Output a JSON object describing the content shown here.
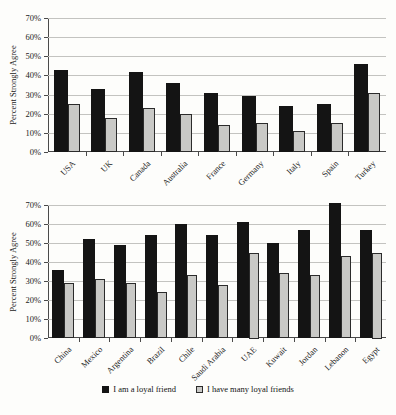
{
  "chart_data": [
    {
      "type": "bar",
      "panel": "western-countries",
      "title": "",
      "ylabel": "Percent Strongly Agree",
      "xlabel": "",
      "ylim": [
        0,
        70
      ],
      "ytick_step": 10,
      "ytick_format": "percent",
      "grid": "horizontal",
      "categories": [
        "USA",
        "UK",
        "Canada",
        "Australia",
        "France",
        "Germany",
        "Italy",
        "Spain",
        "Turkey"
      ],
      "series": [
        {
          "name": "I am a loyal friend",
          "color": "#141414",
          "values": [
            43,
            33,
            42,
            36,
            31,
            29,
            24,
            25,
            46
          ]
        },
        {
          "name": "I have many loyal friends",
          "color": "#c9c9c6",
          "values": [
            25,
            18,
            23,
            20,
            14,
            15,
            11,
            15,
            31
          ]
        }
      ]
    },
    {
      "type": "bar",
      "panel": "non-western-countries",
      "title": "",
      "ylabel": "Percent Strongly Agree",
      "xlabel": "",
      "ylim": [
        0,
        70
      ],
      "ytick_step": 10,
      "ytick_format": "percent",
      "grid": "horizontal",
      "categories": [
        "China",
        "Mexico",
        "Argentina",
        "Brazil",
        "Chile",
        "Saudi Arabia",
        "UAE",
        "Kuwait",
        "Jordan",
        "Lebanon",
        "Egypt"
      ],
      "series": [
        {
          "name": "I am a loyal friend",
          "color": "#141414",
          "values": [
            36,
            52,
            49,
            54,
            60,
            54,
            61,
            50,
            57,
            71,
            57
          ]
        },
        {
          "name": "I have many loyal friends",
          "color": "#c9c9c6",
          "values": [
            29,
            31,
            29,
            24,
            33,
            28,
            45,
            34,
            33,
            43,
            45
          ]
        }
      ]
    }
  ],
  "legend": {
    "items": [
      {
        "label": "I am a loyal friend",
        "color": "#141414"
      },
      {
        "label": "I have many loyal friends",
        "color": "#c9c9c6"
      }
    ],
    "position": "bottom-center"
  },
  "axis_colors": {
    "axis_line": "#4a4a4a",
    "gridline": "#c3c3c0",
    "text": "#222222"
  }
}
